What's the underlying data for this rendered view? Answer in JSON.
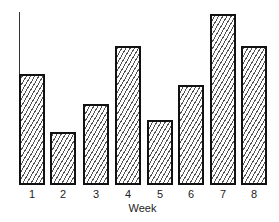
{
  "chart_data": {
    "type": "bar",
    "title": "",
    "xlabel": "Week",
    "ylabel": "",
    "categories": [
      "1",
      "2",
      "3",
      "4",
      "5",
      "6",
      "7",
      "8"
    ],
    "values": [
      111,
      53,
      81,
      139,
      65,
      100,
      171,
      139
    ],
    "value_note": "Relative bar heights (no y-axis ticks shown); units arbitrary",
    "ylim": [
      0,
      175
    ],
    "grid": false,
    "legend": null,
    "bar_style": "diagonal hatch, black outline"
  },
  "layout": {
    "baseline_y": 185,
    "bars": [
      {
        "left": 19,
        "width": 26
      },
      {
        "left": 50,
        "width": 26
      },
      {
        "left": 83,
        "width": 26
      },
      {
        "left": 115,
        "width": 26
      },
      {
        "left": 147,
        "width": 26
      },
      {
        "left": 178,
        "width": 26
      },
      {
        "left": 210,
        "width": 26
      },
      {
        "left": 241,
        "width": 26
      }
    ]
  }
}
